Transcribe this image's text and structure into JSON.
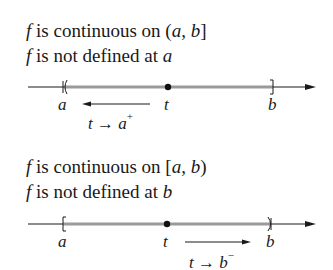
{
  "panels": [
    {
      "line1": {
        "f": "f",
        "text": " is continuous on ",
        "interval_open": "(",
        "a": "a",
        "comma": ", ",
        "b": "b",
        "interval_close": "]"
      },
      "line2": {
        "f": "f",
        "text": " is not defined at ",
        "var": "a"
      },
      "axis_labels": {
        "a": "a",
        "t": "t",
        "b": "b"
      },
      "limit": {
        "t": "t",
        "arrow": " → ",
        "var": "a",
        "sup": "+"
      },
      "arrow_direction": "left"
    },
    {
      "line1": {
        "f": "f",
        "text": " is continuous on ",
        "interval_open": "[",
        "a": "a",
        "comma": ", ",
        "b": "b",
        "interval_close": ")"
      },
      "line2": {
        "f": "f",
        "text": " is not defined at ",
        "var": "b"
      },
      "axis_labels": {
        "a": "a",
        "t": "t",
        "b": "b"
      },
      "limit": {
        "t": "t",
        "arrow": " → ",
        "var": "b",
        "sup": "−"
      },
      "arrow_direction": "right"
    }
  ],
  "colors": {
    "ink": "#1a1a1a",
    "interval": "#9a9a9a",
    "background": "#ffffff"
  }
}
